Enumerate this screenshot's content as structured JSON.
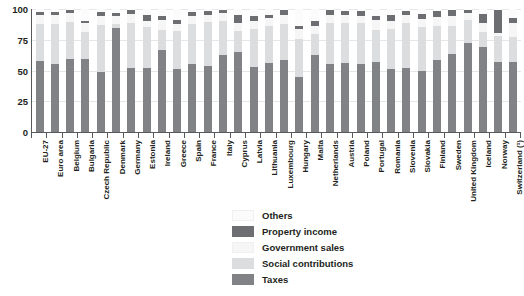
{
  "chart_data": {
    "type": "bar",
    "title": "",
    "subtitle": "",
    "xlabel": "",
    "ylabel": "",
    "ylim": [
      0,
      100
    ],
    "yticks": [
      0,
      25,
      50,
      75,
      100
    ],
    "grid": true,
    "stacked": true,
    "stack_order_bottom_to_top": [
      "Taxes",
      "Social contributions",
      "Government sales",
      "Property income",
      "Others"
    ],
    "legend_position": "bottom-center",
    "legend": [
      {
        "name": "Others",
        "color": "#fbfbfb"
      },
      {
        "name": "Property income",
        "color": "#6d6e71"
      },
      {
        "name": "Government sales",
        "color": "#f6f6f6"
      },
      {
        "name": "Social contributions",
        "color": "#dcdddf"
      },
      {
        "name": "Taxes",
        "color": "#808285"
      }
    ],
    "categories": [
      "EU-27",
      "Euro area",
      "Belgium",
      "Bulgaria",
      "Czech Republic",
      "Denmark",
      "Germany",
      "Estonia",
      "Ireland",
      "Greece",
      "Spain",
      "France",
      "Italy",
      "Cyprus",
      "Latvia",
      "Lithuania",
      "Luxembourg",
      "Hungary",
      "Malta",
      "Netherlands",
      "Austria",
      "Poland",
      "Portugal",
      "Romania",
      "Slovenia",
      "Slovakia",
      "Finland",
      "Sweden",
      "United Kingdom",
      "Iceland",
      "Norway",
      "Switzerland (¹)"
    ],
    "series": [
      {
        "name": "Taxes",
        "color": "#808285",
        "values": [
          58,
          55.5,
          59,
          59.5,
          48.5,
          84.5,
          52,
          52,
          66.5,
          51,
          55.5,
          53.5,
          63,
          65,
          53,
          56.5,
          58.5,
          45,
          63,
          55,
          56,
          55.5,
          57,
          51,
          52,
          50,
          58.5,
          63.5,
          72.5,
          69,
          57,
          57
        ]
      },
      {
        "name": "Social contributions",
        "color": "#dcdddf",
        "values": [
          30,
          32.5,
          30.5,
          22,
          38.5,
          3,
          36.5,
          33,
          16.5,
          31.5,
          32,
          36,
          27,
          17,
          30.5,
          29.5,
          29.5,
          30.5,
          16.5,
          33.5,
          33,
          33,
          26,
          33,
          36.5,
          35.5,
          28,
          22.5,
          18.5,
          12.5,
          21,
          20.5
        ]
      },
      {
        "name": "Government sales",
        "color": "#f6f6f6",
        "values": [
          7,
          7,
          7.5,
          7,
          7,
          6.5,
          7.5,
          5,
          8,
          5.5,
          7,
          6,
          6.5,
          7,
          7,
          6.5,
          7,
          8,
          6.5,
          7,
          6.5,
          6,
          8,
          6.5,
          7,
          6.5,
          7,
          8,
          5.5,
          7,
          2.5,
          11.5
        ]
      },
      {
        "name": "Property income",
        "color": "#6d6e71",
        "values": [
          2.5,
          2.5,
          2.5,
          2,
          3.5,
          2.5,
          3.5,
          5.5,
          3,
          3,
          3,
          3,
          3,
          6.5,
          3.5,
          3,
          4,
          2.5,
          4.5,
          3.5,
          3,
          4,
          3.5,
          4.5,
          3,
          4,
          5,
          5,
          2.5,
          7.5,
          19,
          4
        ]
      },
      {
        "name": "Others",
        "color": "#fbfbfb",
        "values": [
          2.5,
          2.5,
          0.5,
          9.5,
          2.5,
          3.5,
          0.5,
          4.5,
          6,
          9,
          2.5,
          1.5,
          0.5,
          4.5,
          6,
          4.5,
          1,
          14,
          9.5,
          1,
          1.5,
          1.5,
          5.5,
          5,
          1.5,
          4,
          1.5,
          1,
          1,
          4,
          0.5,
          7
        ]
      }
    ]
  },
  "axis": {
    "y_tick_labels": [
      "0",
      "25",
      "50",
      "75",
      "100"
    ]
  }
}
